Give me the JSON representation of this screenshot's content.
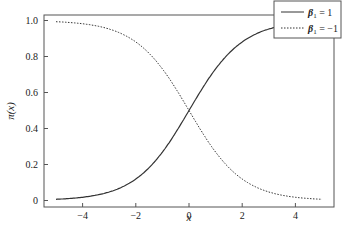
{
  "chart_data": {
    "type": "line",
    "title": "",
    "xlabel": "x",
    "ylabel": "π(x)",
    "xlim": [
      -5,
      5
    ],
    "ylim": [
      0,
      1.0
    ],
    "grid": false,
    "legend_position": "upper right",
    "x_ticks": [
      "-4",
      "-2",
      "0",
      "2",
      "4"
    ],
    "y_ticks": [
      "0",
      "0.2",
      "0.4",
      "0.6",
      "0.8",
      "1.0"
    ],
    "x": [
      -5,
      -4,
      -3,
      -2,
      -1,
      0,
      1,
      2,
      3,
      4,
      5
    ],
    "series": [
      {
        "name": "β1 = 1",
        "style": "solid",
        "values": [
          0.007,
          0.018,
          0.047,
          0.119,
          0.269,
          0.5,
          0.731,
          0.881,
          0.953,
          0.982,
          0.993
        ]
      },
      {
        "name": "β1 = −1",
        "style": "dotted",
        "values": [
          0.993,
          0.982,
          0.953,
          0.881,
          0.731,
          0.5,
          0.269,
          0.119,
          0.047,
          0.018,
          0.007
        ]
      }
    ]
  },
  "axes": {
    "xlabel": "x",
    "ylabel": "π(x)",
    "x_ticks": [
      {
        "value": -4,
        "label": "−4"
      },
      {
        "value": -2,
        "label": "−2"
      },
      {
        "value": 0,
        "label": "0"
      },
      {
        "value": 2,
        "label": "2"
      },
      {
        "value": 4,
        "label": "4"
      }
    ],
    "y_ticks": [
      {
        "value": 0,
        "label": "0"
      },
      {
        "value": 0.2,
        "label": "0.2"
      },
      {
        "value": 0.4,
        "label": "0.4"
      },
      {
        "value": 0.6,
        "label": "0.6"
      },
      {
        "value": 0.8,
        "label": "0.8"
      },
      {
        "value": 1.0,
        "label": "1.0"
      }
    ]
  },
  "legend": {
    "items": [
      {
        "symbol": "β",
        "sub": "1",
        "rest": " = 1",
        "style": "solid"
      },
      {
        "symbol": "β",
        "sub": "1",
        "rest": " = −1",
        "style": "dotted"
      }
    ]
  },
  "colors": {
    "line": "#333333",
    "axis": "#555555"
  }
}
